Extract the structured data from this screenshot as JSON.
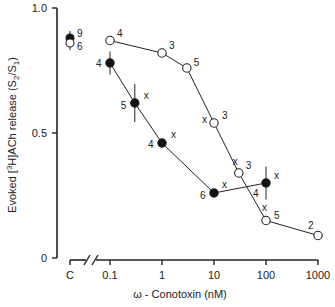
{
  "chart_data": {
    "type": "line",
    "title": "",
    "xlabel": "ω - Conotoxin (nM)",
    "ylabel_parts": {
      "pre": "Evoked  [",
      "sup": "3",
      "mid": "H]ACh release  (S",
      "sub1": "2",
      "slash": "/S",
      "sub2": "1",
      "post": ")"
    },
    "xscale": "log",
    "x_ticks": [
      {
        "label": "C",
        "value": "control"
      },
      {
        "label": "0.1",
        "value": 0.1
      },
      {
        "label": "1",
        "value": 1
      },
      {
        "label": "10",
        "value": 10
      },
      {
        "label": "100",
        "value": 100
      },
      {
        "label": "1000",
        "value": 1000
      }
    ],
    "y_ticks": [
      {
        "label": "0",
        "value": 0
      },
      {
        "label": "0.5",
        "value": 0.5
      },
      {
        "label": "1.0",
        "value": 1.0
      }
    ],
    "ylim": [
      0,
      1.0
    ],
    "xlim": [
      0.1,
      1000
    ],
    "axis_break": true,
    "grid": false,
    "series": [
      {
        "name": "filled",
        "marker": "filled-circle",
        "control": {
          "y": 0.88,
          "n": "9",
          "error": 0.02
        },
        "points": [
          {
            "x": 0.1,
            "y": 0.78,
            "n": "4",
            "error": 0.03,
            "sig": ""
          },
          {
            "x": 0.3,
            "y": 0.62,
            "n": "5",
            "error": 0.06,
            "sig": "x"
          },
          {
            "x": 1,
            "y": 0.46,
            "n": "4",
            "error": 0.0,
            "sig": "x"
          },
          {
            "x": 10,
            "y": 0.26,
            "n": "6",
            "error": 0.0,
            "sig": "x"
          },
          {
            "x": 100,
            "y": 0.3,
            "n": "4",
            "error": 0.05,
            "sig": "x"
          }
        ]
      },
      {
        "name": "open",
        "marker": "open-circle",
        "control": {
          "y": 0.86,
          "n": "6",
          "error": 0.02
        },
        "points": [
          {
            "x": 0.1,
            "y": 0.87,
            "n": "4",
            "error": 0.0,
            "sig": ""
          },
          {
            "x": 1,
            "y": 0.82,
            "n": "3",
            "error": 0.0,
            "sig": ""
          },
          {
            "x": 3,
            "y": 0.76,
            "n": "5",
            "error": 0.0,
            "sig": ""
          },
          {
            "x": 10,
            "y": 0.54,
            "n": "3",
            "error": 0.0,
            "sig": "x"
          },
          {
            "x": 30,
            "y": 0.34,
            "n": "3",
            "error": 0.0,
            "sig": "x"
          },
          {
            "x": 100,
            "y": 0.15,
            "n": "5",
            "error": 0.0,
            "sig": "x"
          },
          {
            "x": 1000,
            "y": 0.09,
            "n": "2",
            "error": 0.0,
            "sig": ""
          }
        ]
      }
    ]
  }
}
